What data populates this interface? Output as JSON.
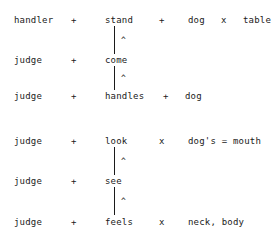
{
  "diagram": {
    "background_color": "#ffffff",
    "text_color": "#1a1a1a",
    "groups": [
      {
        "name": "group-1",
        "rows": [
          {
            "agent": "handler",
            "op1": "+",
            "verb": "stand",
            "op2": "+",
            "object": "dog",
            "op3": "x",
            "object2": "table"
          },
          {
            "agent": "judge",
            "op1": "+",
            "verb": "come",
            "op2": "",
            "object": "",
            "op3": "",
            "object2": ""
          },
          {
            "agent": "judge",
            "op1": "+",
            "verb": "handles",
            "op2": "+",
            "object": "dog",
            "op3": "",
            "object2": ""
          }
        ],
        "connectors": [
          {
            "name": "connector-stand-come",
            "glyph": "^"
          },
          {
            "name": "connector-come-handles",
            "glyph": "^"
          }
        ]
      },
      {
        "name": "group-2",
        "rows": [
          {
            "agent": "judge",
            "op1": "+",
            "verb": "look",
            "op2": "x",
            "object": "dog's = mouth",
            "op3": "",
            "object2": ""
          },
          {
            "agent": "judge",
            "op1": "+",
            "verb": "see",
            "op2": "",
            "object": "",
            "op3": "",
            "object2": ""
          },
          {
            "agent": "judge",
            "op1": "+",
            "verb": "feels",
            "op2": "x",
            "object": "neck, body",
            "op3": "",
            "object2": ""
          }
        ],
        "connectors": [
          {
            "name": "connector-look-see",
            "glyph": "^"
          },
          {
            "name": "connector-see-feels",
            "glyph": "^"
          }
        ]
      }
    ]
  }
}
